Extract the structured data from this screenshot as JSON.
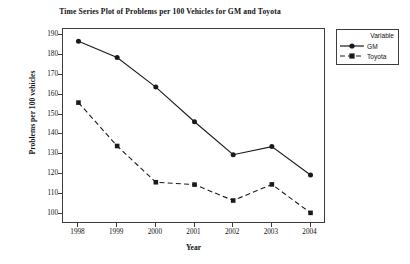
{
  "chart_data": {
    "type": "line",
    "title": "Time Series Plot of Problems per 100 Vehicles for GM and Toyota",
    "xlabel": "Year",
    "ylabel": "Problems per 100 vehicles",
    "categories": [
      1998,
      1999,
      2000,
      2001,
      2002,
      2003,
      2004
    ],
    "x_tick_labels": [
      "1998",
      "1999",
      "2000",
      "2001",
      "2002",
      "2003",
      "2004"
    ],
    "y_tick_labels": [
      "100",
      "110",
      "120",
      "130",
      "140",
      "150",
      "160",
      "170",
      "180",
      "190"
    ],
    "y_ticks": [
      100,
      110,
      120,
      130,
      140,
      150,
      160,
      170,
      180,
      190
    ],
    "ylim": [
      95,
      193
    ],
    "xlim": [
      1997.6,
      2004.4
    ],
    "grid": false,
    "legend_position": "right-outside",
    "legend_title": "Variable",
    "series": [
      {
        "name": "GM",
        "values": [
          186.8,
          178.7,
          163.8,
          146.4,
          129.8,
          133.9,
          119.6
        ],
        "line_style": "solid",
        "marker": "circle",
        "color": "#1a1a1a"
      },
      {
        "name": "Toyota",
        "values": [
          156.0,
          134.2,
          116.0,
          114.8,
          106.8,
          114.9,
          100.6
        ],
        "line_style": "dashed",
        "marker": "square",
        "color": "#1a1a1a"
      }
    ]
  },
  "legend": {
    "title": "Variable",
    "entries": [
      {
        "label": "GM",
        "marker": "circle-marker",
        "line": "solid"
      },
      {
        "label": "Toyota",
        "marker": "square-marker",
        "line": "dashed"
      }
    ]
  },
  "colors": {
    "axis": "#3c3c3c",
    "series": "#1a1a1a",
    "background": "#ffffff"
  }
}
